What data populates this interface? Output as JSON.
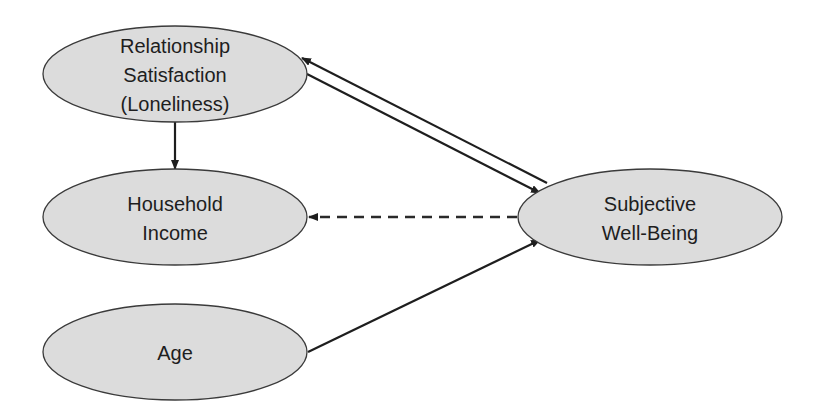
{
  "diagram": {
    "type": "path-model",
    "colors": {
      "node_fill": "#dcdcdc",
      "node_stroke": "#3a3a3a",
      "edge": "#1e1e1e",
      "background": "#ffffff"
    },
    "nodes": [
      {
        "id": "relationship",
        "lines": [
          "Relationship",
          "Satisfaction",
          "(Loneliness)"
        ]
      },
      {
        "id": "income",
        "lines": [
          "Household",
          "Income"
        ]
      },
      {
        "id": "age",
        "lines": [
          "Age"
        ]
      },
      {
        "id": "swb",
        "lines": [
          "Subjective",
          "Well-Being"
        ]
      }
    ],
    "edges": [
      {
        "from": "relationship",
        "to": "income",
        "style": "solid"
      },
      {
        "from": "swb",
        "to": "relationship",
        "style": "solid"
      },
      {
        "from": "relationship",
        "to": "swb",
        "style": "solid"
      },
      {
        "from": "swb",
        "to": "income",
        "style": "dashed"
      },
      {
        "from": "age",
        "to": "swb",
        "style": "solid"
      }
    ]
  }
}
